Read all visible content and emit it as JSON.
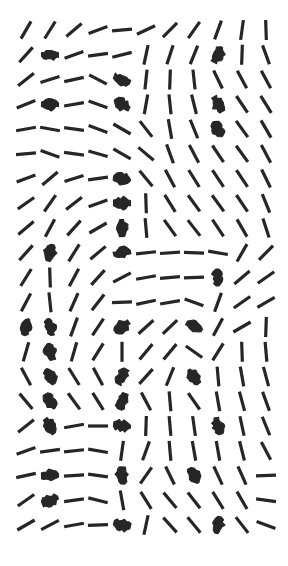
{
  "figure": {
    "title": "",
    "background_color": "#ffffff",
    "width": 288,
    "height": 566
  },
  "chart_data": {
    "type": "scatter",
    "plot_kind": "director-field",
    "title": "",
    "subtitle": "",
    "xlabel": "",
    "ylabel": "",
    "grid": false,
    "legend": null,
    "annotations": [],
    "axis_visible": false,
    "tick_labels_x": [],
    "tick_labels_y": [],
    "mark": {
      "shape": "line-segment",
      "color": "#262626",
      "normal_length_px": 20,
      "normal_width_px": 3.2,
      "bold_length_px": 17,
      "bold_width_px": 9,
      "note": "angle is measured in degrees counter-clockwise from the +x axis; segments are headless (nematic directors). weight 2 marks are rendered thick/blob-like."
    },
    "grid_layout": {
      "columns": 11,
      "rows": 21,
      "x_start": 26,
      "y_start": 30,
      "x_step": 24.0,
      "y_step": 24.75
    },
    "xlim": [
      0,
      288
    ],
    "ylim": [
      0,
      566
    ],
    "columns_x": [
      26,
      50,
      74,
      98,
      122,
      146,
      170,
      194,
      218,
      242,
      266
    ],
    "rows_y": [
      30,
      54.8,
      79.5,
      104.3,
      129,
      153.8,
      178.5,
      203.3,
      228,
      252.8,
      277.5,
      302.3,
      327,
      351.8,
      376.5,
      401.3,
      426,
      450.8,
      475.5,
      500.3,
      525
    ],
    "angles_deg": [
      [
        60,
        58,
        40,
        20,
        5,
        25,
        45,
        55,
        70,
        82,
        92
      ],
      [
        48,
        0,
        20,
        8,
        14,
        78,
        72,
        68,
        62,
        88,
        110
      ],
      [
        38,
        18,
        12,
        152,
        158,
        84,
        88,
        96,
        116,
        118,
        118
      ],
      [
        22,
        0,
        10,
        160,
        152,
        80,
        96,
        104,
        120,
        124,
        122
      ],
      [
        10,
        170,
        172,
        160,
        150,
        128,
        100,
        112,
        122,
        126,
        120
      ],
      [
        5,
        160,
        172,
        164,
        150,
        140,
        110,
        118,
        124,
        126,
        118
      ],
      [
        20,
        40,
        18,
        8,
        170,
        130,
        118,
        122,
        124,
        124,
        116
      ],
      [
        35,
        55,
        38,
        20,
        0,
        92,
        122,
        126,
        126,
        124,
        112
      ],
      [
        40,
        62,
        48,
        30,
        92,
        95,
        126,
        128,
        124,
        120,
        108
      ],
      [
        48,
        78,
        58,
        40,
        14,
        6,
        4,
        178,
        170,
        60,
        45
      ],
      [
        58,
        92,
        62,
        48,
        28,
        10,
        5,
        2,
        92,
        40,
        35
      ],
      [
        62,
        96,
        66,
        52,
        2,
        12,
        10,
        160,
        70,
        35,
        30
      ],
      [
        70,
        100,
        70,
        56,
        35,
        42,
        44,
        150,
        62,
        30,
        88
      ],
      [
        74,
        104,
        74,
        58,
        90,
        50,
        50,
        145,
        58,
        92,
        95
      ],
      [
        118,
        120,
        122,
        118,
        62,
        48,
        68,
        130,
        95,
        100,
        105
      ],
      [
        130,
        122,
        126,
        122,
        70,
        118,
        95,
        125,
        100,
        105,
        110
      ],
      [
        38,
        126,
        10,
        0,
        172,
        88,
        95,
        98,
        100,
        102,
        112
      ],
      [
        20,
        8,
        6,
        170,
        82,
        70,
        95,
        100,
        100,
        104,
        118
      ],
      [
        12,
        2,
        4,
        172,
        88,
        55,
        116,
        118,
        115,
        114,
        2
      ],
      [
        35,
        22,
        8,
        166,
        100,
        122,
        130,
        128,
        122,
        120,
        172
      ],
      [
        30,
        28,
        10,
        2,
        166,
        78,
        132,
        130,
        80,
        128,
        160
      ]
    ],
    "weights": [
      [
        1,
        1,
        1,
        1,
        1,
        1,
        1,
        1,
        1,
        1,
        1
      ],
      [
        1,
        2,
        1,
        1,
        1,
        1,
        1,
        1,
        2,
        1,
        1
      ],
      [
        1,
        1,
        1,
        1,
        2,
        1,
        1,
        1,
        1,
        1,
        1
      ],
      [
        1,
        2,
        1,
        1,
        2,
        1,
        1,
        1,
        2,
        1,
        1
      ],
      [
        1,
        1,
        1,
        1,
        1,
        1,
        1,
        1,
        2,
        1,
        1
      ],
      [
        1,
        1,
        1,
        1,
        1,
        1,
        1,
        1,
        1,
        1,
        1
      ],
      [
        1,
        1,
        1,
        1,
        2,
        1,
        1,
        1,
        1,
        1,
        1
      ],
      [
        1,
        1,
        1,
        1,
        2,
        1,
        1,
        1,
        1,
        1,
        1
      ],
      [
        1,
        1,
        1,
        1,
        2,
        1,
        1,
        1,
        1,
        1,
        1
      ],
      [
        1,
        2,
        1,
        1,
        2,
        1,
        1,
        1,
        1,
        1,
        1
      ],
      [
        1,
        1,
        1,
        1,
        1,
        1,
        1,
        1,
        2,
        1,
        1
      ],
      [
        1,
        1,
        1,
        1,
        1,
        1,
        1,
        1,
        1,
        1,
        1
      ],
      [
        2,
        2,
        1,
        1,
        2,
        1,
        1,
        2,
        1,
        1,
        1
      ],
      [
        1,
        2,
        1,
        1,
        1,
        1,
        1,
        1,
        1,
        1,
        1
      ],
      [
        1,
        2,
        1,
        1,
        2,
        1,
        1,
        2,
        1,
        1,
        1
      ],
      [
        1,
        2,
        1,
        1,
        2,
        1,
        1,
        1,
        1,
        1,
        1
      ],
      [
        1,
        2,
        1,
        1,
        2,
        1,
        1,
        1,
        2,
        1,
        1
      ],
      [
        1,
        1,
        1,
        1,
        1,
        1,
        1,
        1,
        1,
        1,
        1
      ],
      [
        1,
        2,
        1,
        1,
        2,
        1,
        1,
        2,
        1,
        1,
        1
      ],
      [
        1,
        2,
        1,
        1,
        1,
        1,
        1,
        1,
        1,
        1,
        1
      ],
      [
        1,
        1,
        1,
        1,
        2,
        1,
        1,
        1,
        2,
        1,
        1
      ]
    ]
  }
}
